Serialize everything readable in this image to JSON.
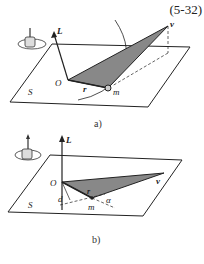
{
  "equation_number": "(5-32)",
  "figure_a": {
    "caption": "a)",
    "labels": {
      "axis": "L",
      "origin": "O",
      "radius": "r",
      "point": "m",
      "velocity": "v",
      "plane": "S"
    },
    "icon": "right-hand-rule-icon"
  },
  "figure_b": {
    "caption": "b)",
    "labels": {
      "axis": "L",
      "origin": "O",
      "radius": "r",
      "point": "m",
      "velocity": "v",
      "plane": "S",
      "distance": "d",
      "angle": "α"
    },
    "icon": "right-hand-rule-icon"
  },
  "colors": {
    "shade": "#888888",
    "line": "#222222"
  }
}
